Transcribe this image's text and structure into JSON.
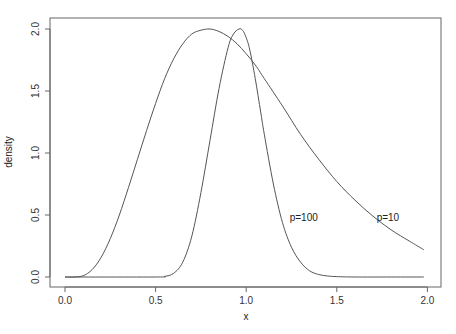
{
  "chart_data": {
    "type": "line",
    "title": "",
    "xlabel": "x",
    "ylabel": "density",
    "xlim": [
      0,
      2
    ],
    "ylim": [
      0,
      2
    ],
    "x_ticks": [
      "0.0",
      "0.5",
      "1.0",
      "1.5",
      "2.0"
    ],
    "y_ticks": [
      "0.0",
      "0.5",
      "1.0",
      "1.5",
      "2.0"
    ],
    "grid": false,
    "legend": "none (inline labels)",
    "series": [
      {
        "name": "p=10",
        "label": "p=10",
        "label_pos": [
          1.72,
          0.48
        ],
        "x": [
          0,
          0.05,
          0.1,
          0.15,
          0.2,
          0.25,
          0.3,
          0.35,
          0.4,
          0.45,
          0.5,
          0.55,
          0.6,
          0.65,
          0.7,
          0.75,
          0.8,
          0.85,
          0.9,
          0.95,
          1.0,
          1.05,
          1.1,
          1.2,
          1.3,
          1.4,
          1.5,
          1.6,
          1.7,
          1.8,
          1.9,
          1.98
        ],
        "values": [
          0,
          0.0,
          0.01,
          0.06,
          0.16,
          0.31,
          0.5,
          0.72,
          0.95,
          1.18,
          1.4,
          1.6,
          1.76,
          1.88,
          1.96,
          1.99,
          2.0,
          1.98,
          1.94,
          1.88,
          1.8,
          1.71,
          1.6,
          1.38,
          1.15,
          0.95,
          0.77,
          0.62,
          0.49,
          0.38,
          0.29,
          0.22
        ]
      },
      {
        "name": "p=100",
        "label": "p=100",
        "label_pos": [
          1.24,
          0.48
        ],
        "x": [
          0,
          0.5,
          0.55,
          0.6,
          0.65,
          0.7,
          0.75,
          0.8,
          0.85,
          0.9,
          0.93,
          0.96,
          0.98,
          1.0,
          1.02,
          1.05,
          1.08,
          1.1,
          1.15,
          1.2,
          1.25,
          1.3,
          1.35,
          1.4,
          1.45,
          1.5,
          1.6,
          1.8,
          1.98
        ],
        "values": [
          0,
          0,
          0.005,
          0.03,
          0.12,
          0.33,
          0.68,
          1.1,
          1.52,
          1.85,
          1.96,
          2.0,
          1.99,
          1.93,
          1.83,
          1.6,
          1.33,
          1.15,
          0.75,
          0.44,
          0.24,
          0.12,
          0.05,
          0.02,
          0.008,
          0.003,
          0,
          0,
          0
        ]
      }
    ]
  }
}
